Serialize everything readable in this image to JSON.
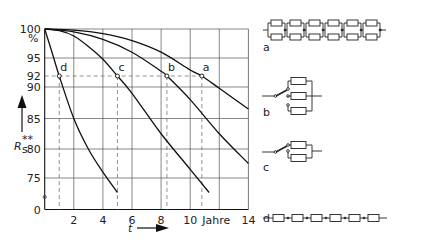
{
  "chart_data": {
    "type": "line",
    "title": "",
    "xlabel": "t",
    "xunit": "Jahre",
    "ylabel": "R_s**",
    "yunit": "%",
    "xlim": [
      0,
      14
    ],
    "ylim": [
      70,
      100
    ],
    "grid": true,
    "x_ticks": [
      {
        "value": 0,
        "label": "0"
      },
      {
        "value": 2,
        "label": "2"
      },
      {
        "value": 4,
        "label": "4"
      },
      {
        "value": 6,
        "label": "6"
      },
      {
        "value": 8,
        "label": "8"
      },
      {
        "value": 10,
        "label": "10"
      },
      {
        "value": 12,
        "label": "Jahre"
      },
      {
        "value": 14,
        "label": "14"
      }
    ],
    "y_ticks": [
      {
        "value": 100,
        "label": "100"
      },
      {
        "value": 95,
        "label": "95"
      },
      {
        "value": 92,
        "label": "92"
      },
      {
        "value": 90,
        "label": "90"
      },
      {
        "value": 85,
        "label": "85"
      },
      {
        "value": 80,
        "label": "80"
      },
      {
        "value": 75,
        "label": "75"
      },
      {
        "value": 0,
        "label": "0"
      }
    ],
    "y_unit_label": "%",
    "reference_level": 92,
    "series": [
      {
        "name": "a",
        "x": [
          0,
          2,
          4,
          6,
          8,
          10,
          10.8,
          12,
          14
        ],
        "y": [
          100,
          99.8,
          99.2,
          98,
          96,
          93,
          92,
          89.8,
          86.5
        ]
      },
      {
        "name": "b",
        "x": [
          0,
          2,
          4,
          6,
          8,
          8.4,
          10,
          12,
          14
        ],
        "y": [
          100,
          99.5,
          98.2,
          96,
          92.8,
          92,
          88,
          82.5,
          77.5
        ]
      },
      {
        "name": "c",
        "x": [
          0,
          1,
          2,
          3,
          4,
          5,
          6,
          8,
          10,
          11.3
        ],
        "y": [
          100,
          99.7,
          98.8,
          97,
          94.8,
          92,
          89,
          82.5,
          76.5,
          72.5
        ]
      },
      {
        "name": "d",
        "x": [
          0,
          0.5,
          1,
          2,
          3,
          4,
          5
        ],
        "y": [
          100,
          96,
          92,
          85,
          80,
          76,
          72.5
        ]
      }
    ],
    "markers": [
      {
        "series": "d",
        "x": 1.0,
        "y": 92,
        "label": "d"
      },
      {
        "series": "c",
        "x": 5.0,
        "y": 92,
        "label": "c"
      },
      {
        "series": "b",
        "x": 8.4,
        "y": 92,
        "label": "b"
      },
      {
        "series": "a",
        "x": 10.8,
        "y": 92,
        "label": "a"
      }
    ]
  },
  "axis": {
    "y_label": "R",
    "y_label_sub": "s",
    "y_label_sup": "**",
    "y_unit": "%",
    "x_label": "t",
    "x_unit": "Jahre"
  },
  "diagrams": [
    {
      "label": "a",
      "description": "6 blocks in series, each block: 2 resistors in parallel"
    },
    {
      "label": "b",
      "description": "switch selecting one of 3 parallel resistors"
    },
    {
      "label": "c",
      "description": "switch selecting one of 2 parallel resistors"
    },
    {
      "label": "d",
      "description": "6 resistors in series"
    }
  ]
}
